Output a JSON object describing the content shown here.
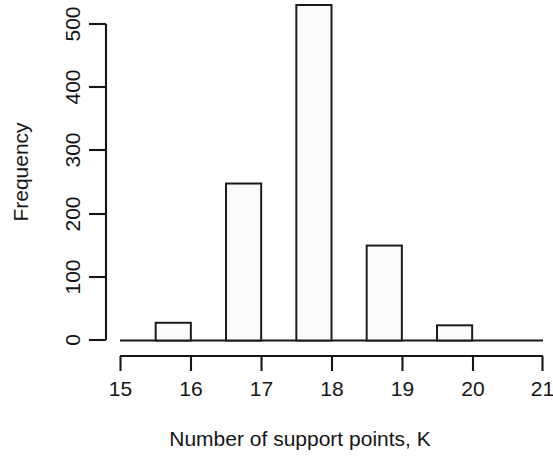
{
  "chart_data": {
    "type": "bar",
    "title": "",
    "subtitle": "",
    "xlabel": "Number of support points, K",
    "ylabel": "Frequency",
    "xlim": [
      15,
      21
    ],
    "ylim": [
      0,
      530
    ],
    "grid": false,
    "legend": null,
    "annotations": [],
    "bin_width": 0.5,
    "x_tick_labels": [
      "15",
      "16",
      "17",
      "18",
      "19",
      "20",
      "21"
    ],
    "x_tick_values": [
      15,
      16,
      17,
      18,
      19,
      20,
      21
    ],
    "y_tick_labels": [
      "0",
      "100",
      "200",
      "300",
      "400",
      "500"
    ],
    "y_tick_values": [
      0,
      100,
      200,
      300,
      400,
      500
    ],
    "categories": [
      "15.5-16",
      "16.5-17",
      "17.5-18",
      "18.5-19",
      "19.5-20"
    ],
    "bins": [
      {
        "label": "15.5-16",
        "x_start": 15.5,
        "x_end": 16.0,
        "value": 28
      },
      {
        "label": "16.5-17",
        "x_start": 16.5,
        "x_end": 17.0,
        "value": 248
      },
      {
        "label": "17.5-18",
        "x_start": 17.5,
        "x_end": 18.0,
        "value": 530
      },
      {
        "label": "18.5-19",
        "x_start": 18.5,
        "x_end": 19.0,
        "value": 150
      },
      {
        "label": "19.5-20",
        "x_start": 19.5,
        "x_end": 20.0,
        "value": 24
      }
    ],
    "values": [
      28,
      248,
      530,
      150,
      24
    ],
    "colors": {
      "bar_fill": "#fbfbfb",
      "bar_stroke": "#1b1b1b",
      "axis": "#161616",
      "text": "#151515",
      "background": "#ffffff"
    }
  }
}
